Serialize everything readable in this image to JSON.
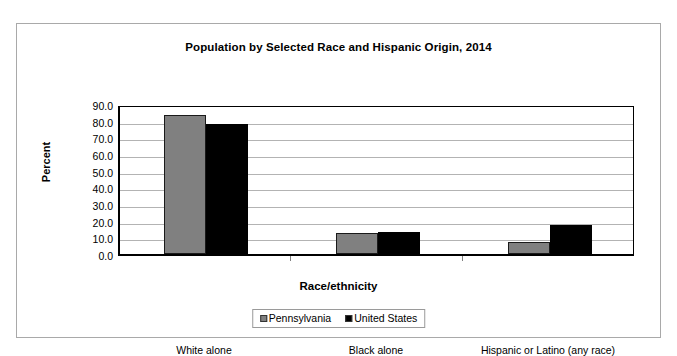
{
  "chart_data": {
    "type": "bar",
    "title": "Population by Selected Race and Hispanic Origin, 2014",
    "xlabel": "Race/ethnicity",
    "ylabel": "Percent",
    "ylim": [
      0,
      90
    ],
    "ytick_labels": [
      "90.0",
      "80.0",
      "70.0",
      "60.0",
      "50.0",
      "40.0",
      "30.0",
      "20.0",
      "10.0",
      "0.0"
    ],
    "ytick_values": [
      90,
      80,
      70,
      60,
      50,
      40,
      30,
      20,
      10,
      0
    ],
    "grid": true,
    "legend_position": "bottom",
    "categories": [
      "White alone",
      "Black alone",
      "Hispanic or Latino (any race)"
    ],
    "series": [
      {
        "name": "Pennsylvania",
        "color": "#808080",
        "values": [
          83.5,
          12.5,
          7.0
        ]
      },
      {
        "name": "United States",
        "color": "#000000",
        "values": [
          78.0,
          13.5,
          17.5
        ]
      }
    ]
  },
  "legend": {
    "items": [
      {
        "label": "Pennsylvania",
        "swatch": "gray-square-swatch"
      },
      {
        "label": "United States",
        "swatch": "black-square-swatch"
      }
    ]
  }
}
